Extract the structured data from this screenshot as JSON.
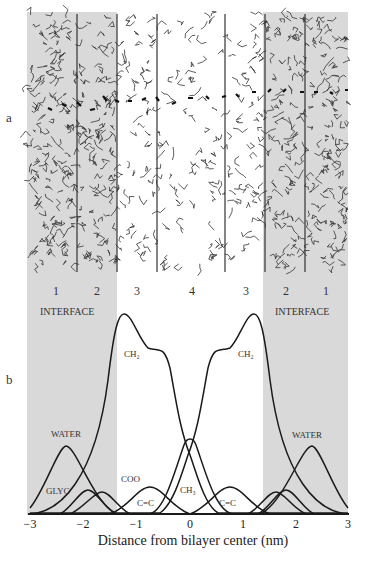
{
  "panels": {
    "a": "a",
    "b": "b"
  },
  "regions": [
    "1",
    "2",
    "3",
    "4",
    "3",
    "2",
    "1"
  ],
  "interface_labels": {
    "left": "INTERFACE",
    "right": "INTERFACE"
  },
  "curve_labels": {
    "ch2_left": "CH₂",
    "ch2_right": "CH₂",
    "water_left": "WATER",
    "water_right": "WATER",
    "glyc": "GLYC",
    "coo": "COO",
    "cc_left": "C=C",
    "cc_right": "C=C",
    "ch3": "CH₃"
  },
  "x_ticks": [
    "−3",
    "−2",
    "−1",
    "0",
    "1",
    "2",
    "3"
  ],
  "x_axis_label": "Distance from bilayer center (nm)",
  "colors": {
    "shade": "#d9d9d9",
    "line": "#1a1a1a"
  },
  "chart_data": {
    "type": "line",
    "title": "",
    "xlabel": "Distance from bilayer center (nm)",
    "ylabel": "",
    "xlim": [
      -3,
      3
    ],
    "x_ticks": [
      -3,
      -2,
      -1,
      0,
      1,
      2,
      3
    ],
    "shaded_regions_nm": [
      [
        -3,
        -1.35
      ],
      [
        1.35,
        3
      ]
    ],
    "region_boundaries_nm": [
      -2.1,
      -1.35,
      -0.6,
      0.65,
      1.4,
      2.15
    ],
    "region_labels": [
      "1",
      "2",
      "3",
      "4",
      "3",
      "2",
      "1"
    ],
    "series": [
      {
        "name": "CH2",
        "description": "two-sided profile, peaks near ±1.2 nm, shoulders near ±0.6 nm, minimum at 0",
        "peak_x": [
          -1.2,
          1.2
        ],
        "relative_peak_height": 1.0
      },
      {
        "name": "CH3",
        "description": "peak at bilayer center",
        "peak_x": [
          0
        ],
        "relative_peak_height": 0.37
      },
      {
        "name": "WATER",
        "peak_x": [
          -2.2,
          2.2
        ],
        "relative_peak_height": 0.33
      },
      {
        "name": "GLYC",
        "peak_x": [
          -1.8,
          1.8
        ],
        "relative_peak_height": 0.12
      },
      {
        "name": "COO",
        "peak_x": [
          -1.55,
          1.6
        ],
        "relative_peak_height": 0.11
      },
      {
        "name": "C=C",
        "peak_x": [
          -0.75,
          0.75
        ],
        "relative_peak_height": 0.13
      }
    ]
  }
}
